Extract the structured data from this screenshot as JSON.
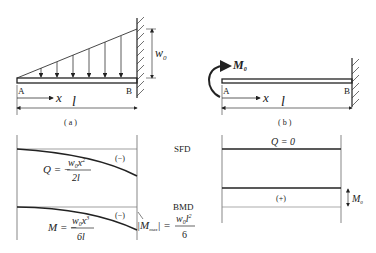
{
  "figure_a": {
    "caption": "( a )",
    "point_left": "A",
    "point_right": "B",
    "axis_label": "x",
    "length_label": "l",
    "load_label": "w",
    "load_sub": "0"
  },
  "figure_b": {
    "caption": "( b )",
    "point_left": "A",
    "point_right": "B",
    "axis_label": "x",
    "length_label": "l",
    "moment_label": "M",
    "moment_sub": "0"
  },
  "sfd": {
    "title": "SFD",
    "a_sign": "(−)",
    "a_eq_lhs": "Q = −",
    "a_eq_num": "w",
    "a_eq_num_sub": "0",
    "a_eq_num_var": "x",
    "a_eq_num_sup": "2",
    "a_eq_den": "2l",
    "b_label": "Q = 0"
  },
  "bmd": {
    "title": "BMD",
    "a_sign": "(−)",
    "a_eq_lhs": "M = −",
    "a_eq_num": "w",
    "a_eq_num_sub": "0",
    "a_eq_num_var": "x",
    "a_eq_num_sup": "3",
    "a_eq_den": "6l",
    "max_lhs": "|M",
    "max_sub": "max",
    "max_rhs": "| =",
    "max_num": "w",
    "max_num_sub": "0",
    "max_num_var": "l",
    "max_num_sup": "2",
    "max_den": "6",
    "b_sign": "(+)",
    "b_dim_label": "M",
    "b_dim_sub": "0"
  }
}
